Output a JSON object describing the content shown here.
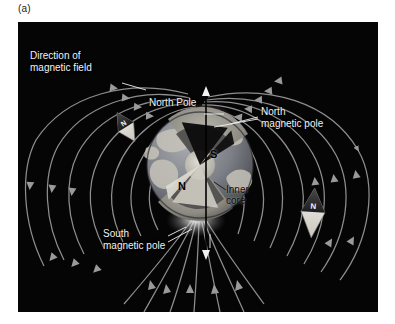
{
  "figure": {
    "panel_label": "(a)",
    "background_color": "#ffffff",
    "panel_background_color": "#050505"
  },
  "diagram": {
    "title_labels": [
      {
        "id": "direction-of-magnetic-field",
        "text_line1": "Direction of",
        "text_line2": "magnetic field"
      },
      {
        "id": "north-pole",
        "text": "North Pole"
      },
      {
        "id": "north-magnetic-pole",
        "text_line1": "North",
        "text_line2": "magnetic pole"
      },
      {
        "id": "south-magnetic-pole",
        "text_line1": "South",
        "text_line2": "magnetic pole"
      },
      {
        "id": "inner-core",
        "text_line1": "Inner",
        "text_line2": "core"
      }
    ],
    "labels": {
      "direction_of_magnetic_field_line1": "Direction of",
      "direction_of_magnetic_field_line2": "magnetic field",
      "north_pole": "North Pole",
      "north_magnetic_pole_line1": "North",
      "north_magnetic_pole_line2": "magnetic pole",
      "south_magnetic_pole_line1": "South",
      "south_magnetic_pole_line2": "magnetic pole",
      "inner_core_line1": "Inner",
      "inner_core_line2": "core"
    },
    "magnet_letters": {
      "south_pole_letter": "S",
      "north_pole_letter": "N"
    },
    "compasses": [
      {
        "id": "compass-left",
        "needle_letter": "N",
        "rotation_deg": -32
      },
      {
        "id": "compass-right",
        "needle_letter": "N",
        "rotation_deg": 4
      }
    ],
    "colors": {
      "field_line": "#8e8e8e",
      "field_arrow": "#9a9a9a",
      "label_text": "#f2f2f2",
      "dark_label_text": "#0a0a0a",
      "axis_line": "#000000",
      "earth_ocean": "#6d7176",
      "earth_land": "#c9c6bd",
      "mantle": "#8c8c8c",
      "outer_core": "#3a3a3a",
      "inner_core": "#b5b2aa",
      "bar_magnet_dark": "#101010",
      "bar_magnet_light": "#d8d5cc",
      "compass_dark": "#2b2b2b",
      "compass_light": "#eceae4"
    }
  }
}
